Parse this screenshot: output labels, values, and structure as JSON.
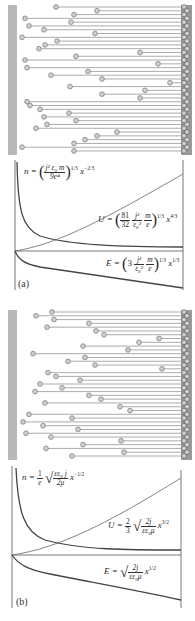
{
  "figure": {
    "panel_a": {
      "label": "(a)",
      "particle_diagram": {
        "description": "electrons emitted from left cathode traveling to right anode, space-charge limited, non-relativistic",
        "left_plate_color": "#b8b8b8",
        "right_plate_color": "#9a9a9a",
        "particle_color": "#cfcfcf",
        "particle_rows": 36
      },
      "formulas": {
        "n": {
          "lhs": "n",
          "text": "n = (j² ε₀ m / 9e⁴)^(1/3) x^(-2/3)"
        },
        "U": {
          "lhs": "U",
          "text": "U = (81/32 · j²/ε₀² · m/e)^(1/3) x^(4/3)"
        },
        "E": {
          "lhs": "E",
          "text": "E = (3 · j²/ε₀² · m/e)^(1/3) x^(1/3)"
        }
      }
    },
    "panel_b": {
      "label": "(b)",
      "particle_diagram": {
        "description": "electrons emitted from left cathode traveling to right anode, mobility-limited",
        "left_plate_color": "#b8b8b8",
        "right_plate_color": "#9a9a9a",
        "particle_color": "#cfcfcf",
        "particle_rows": 36
      },
      "formulas": {
        "n": {
          "lhs": "n",
          "text": "n = (1/e) √(εε₀ j / 2μ) x^(-1/2)"
        },
        "U": {
          "lhs": "U",
          "text": "U = (2/3) √(2j / εε₀μ) x^(3/2)"
        },
        "E": {
          "lhs": "E",
          "text": "E = √(2j / εε₀μ) x^(1/2)"
        }
      }
    }
  },
  "text": {
    "a_label": "(a)",
    "b_label": "(b)",
    "a_n_lhs": "n =",
    "a_n_num": "j² ε₀ m",
    "a_n_den": "9e⁴",
    "a_n_exp": "1/3",
    "a_n_x": "x",
    "a_n_xexp": "−2/3",
    "a_U_lhs": "U =",
    "a_U_c_num": "81",
    "a_U_c_den": "32",
    "a_U_f1_num": "j²",
    "a_U_f1_den": "ε₀²",
    "a_U_f2_num": "m",
    "a_U_f2_den": "e",
    "a_U_exp": "1/3",
    "a_U_x": "x",
    "a_U_xexp": "4/3",
    "a_E_lhs": "E =",
    "a_E_c": "3",
    "a_E_f1_num": "j²",
    "a_E_f1_den": "ε₀²",
    "a_E_f2_num": "m",
    "a_E_f2_den": "e",
    "a_E_exp": "1/3",
    "a_E_x": "x",
    "a_E_xexp": "1/3",
    "b_n_lhs": "n =",
    "b_n_c_num": "1",
    "b_n_c_den": "e",
    "b_n_r_num": "εε₀ j",
    "b_n_r_den": "2μ",
    "b_n_x": "x",
    "b_n_xexp": "−1/2",
    "b_U_lhs": "U =",
    "b_U_c_num": "2",
    "b_U_c_den": "3",
    "b_U_r_num": "2j",
    "b_U_r_den": "εε₀μ",
    "b_U_x": "x",
    "b_U_xexp": "3/2",
    "b_E_lhs": "E =",
    "b_E_r_num": "2j",
    "b_E_r_den": "εε₀μ",
    "b_E_x": "x",
    "b_E_xexp": "1/2"
  },
  "chart_data": [
    {
      "type": "line",
      "title": "(a)",
      "xlabel": "x",
      "ylabel": "",
      "grid": false,
      "series": [
        {
          "name": "n ∝ x^(-2/3)",
          "shape": "decreasing, asymptotic",
          "x": [
            0.02,
            0.05,
            0.1,
            0.2,
            0.4,
            0.6,
            0.8,
            1.0
          ],
          "values": [
            0.95,
            0.55,
            0.38,
            0.27,
            0.2,
            0.16,
            0.14,
            0.12
          ]
        },
        {
          "name": "U ∝ x^(4/3)",
          "shape": "increasing, convex",
          "x": [
            0,
            0.2,
            0.4,
            0.6,
            0.8,
            1.0
          ],
          "values": [
            0,
            0.12,
            0.29,
            0.5,
            0.74,
            1.0
          ]
        },
        {
          "name": "E ∝ x^(1/3)",
          "shape": "negative, decreasing",
          "x": [
            0,
            0.05,
            0.1,
            0.2,
            0.4,
            0.6,
            0.8,
            1.0
          ],
          "values": [
            0,
            -0.18,
            -0.23,
            -0.29,
            -0.37,
            -0.42,
            -0.46,
            -0.5
          ]
        }
      ]
    },
    {
      "type": "line",
      "title": "(b)",
      "xlabel": "x",
      "ylabel": "",
      "grid": false,
      "series": [
        {
          "name": "n ∝ x^(-1/2)",
          "shape": "decreasing, asymptotic",
          "x": [
            0.02,
            0.05,
            0.1,
            0.2,
            0.4,
            0.6,
            0.8,
            1.0
          ],
          "values": [
            0.95,
            0.6,
            0.43,
            0.31,
            0.22,
            0.18,
            0.16,
            0.14
          ]
        },
        {
          "name": "U ∝ x^(3/2)",
          "shape": "increasing, convex",
          "x": [
            0,
            0.2,
            0.4,
            0.6,
            0.8,
            1.0
          ],
          "values": [
            0,
            0.09,
            0.25,
            0.46,
            0.72,
            1.0
          ]
        },
        {
          "name": "E ∝ x^(1/2)",
          "shape": "negative, decreasing",
          "x": [
            0,
            0.05,
            0.1,
            0.2,
            0.4,
            0.6,
            0.8,
            1.0
          ],
          "values": [
            0,
            -0.11,
            -0.16,
            -0.22,
            -0.32,
            -0.39,
            -0.45,
            -0.5
          ]
        }
      ]
    }
  ]
}
